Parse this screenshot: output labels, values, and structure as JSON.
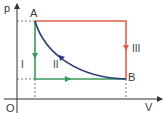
{
  "axes": {
    "y_label": "p",
    "x_label": "V",
    "origin_label": "O"
  },
  "points": {
    "A": {
      "label": "A"
    },
    "B": {
      "label": "B"
    }
  },
  "processes": [
    {
      "id": "I",
      "label": "I",
      "color": "#3a9a5a",
      "path": "A → vertical down → horizontal right → B"
    },
    {
      "id": "II",
      "label": "II",
      "color": "#2a3a7a",
      "path": "A → curve → B"
    },
    {
      "id": "III",
      "label": "III",
      "color": "#e0604a",
      "path": "A → horizontal right → vertical down → B"
    }
  ],
  "colors": {
    "axis": "#333333",
    "dashed": "#555555",
    "process_I": "#3a9a5a",
    "process_II": "#2a3a7a",
    "process_III": "#e0604a"
  }
}
